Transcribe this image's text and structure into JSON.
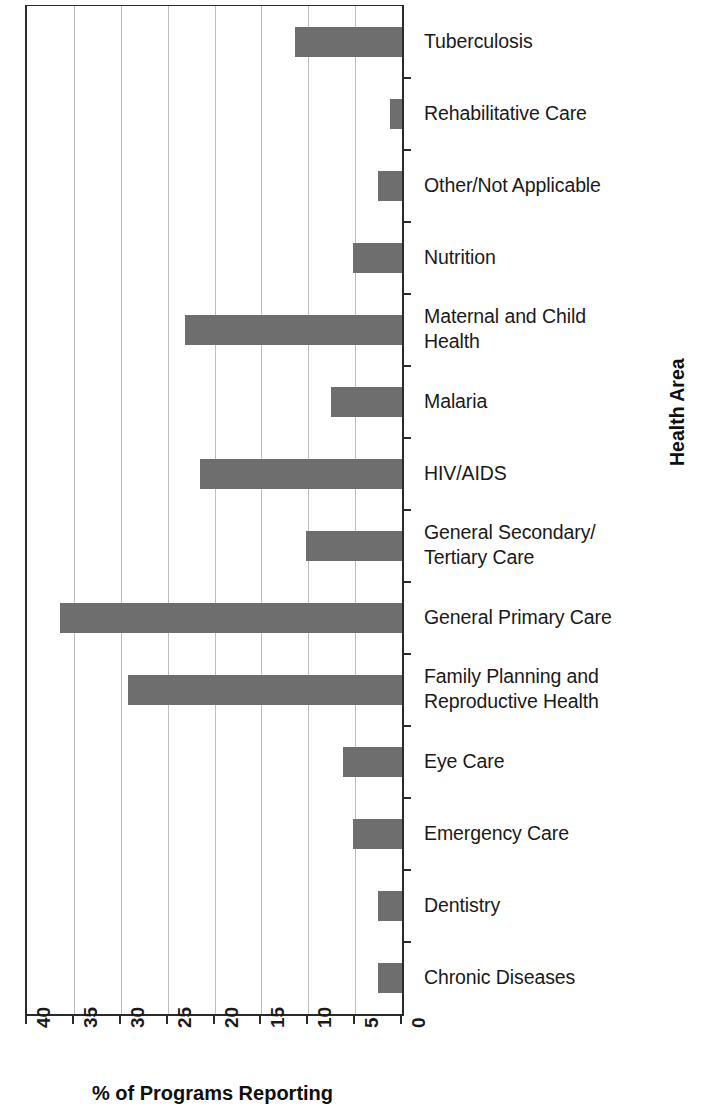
{
  "chart_data": {
    "type": "bar",
    "orientation": "horizontal",
    "title": "",
    "xlabel": "% of Programs Reporting",
    "ylabel": "Health Area",
    "xlim": [
      40,
      0
    ],
    "x_reversed": true,
    "xticks": [
      40,
      35,
      30,
      25,
      20,
      15,
      10,
      5,
      0
    ],
    "xtick_labels": [
      "40",
      "35",
      "30",
      "25",
      "20",
      "15",
      "10",
      "5",
      "0"
    ],
    "grid": "vertical",
    "legend": "none",
    "bar_color": "#6e6e6e",
    "axis_color": "#2a2a2a",
    "gridline_color": "#bdbdbd",
    "categories": [
      "Tuberculosis",
      "Rehabilitative Care",
      "Other/Not Applicable",
      "Nutrition",
      "Maternal and Child\nHealth",
      "Malaria",
      "HIV/AIDS",
      "General Secondary/\nTertiary Care",
      "General Primary Care",
      "Family Planning and\nReproductive Health",
      "Eye Care",
      "Emergency Care",
      "Dentistry",
      "Chronic Diseases"
    ],
    "values": [
      11.4,
      1.3,
      2.6,
      5.2,
      23.1,
      7.6,
      21.6,
      10.2,
      36.5,
      29.2,
      6.3,
      5.2,
      2.6,
      2.6
    ]
  }
}
